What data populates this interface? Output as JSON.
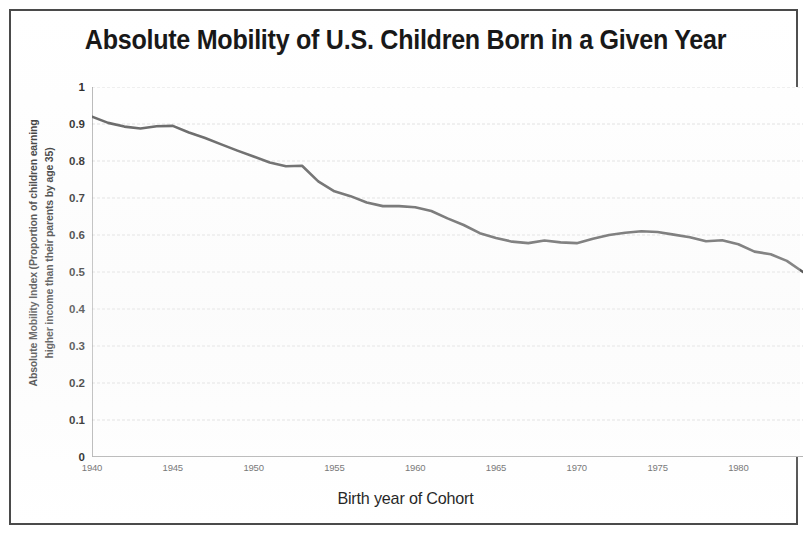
{
  "chart_data": {
    "type": "line",
    "title": "Absolute Mobility of U.S. Children Born in a Given Year",
    "xlabel": "Birth year of Cohort",
    "ylabel": "Absolute Mobility Index (Proportion of children earning higher income than their parents by age 35)",
    "ylabel_line1": "Absolute Mobility Index (Proportion of children earning",
    "ylabel_line2": "higher income than their parents by age 35)",
    "xlim": [
      1940,
      1984
    ],
    "ylim": [
      0,
      1
    ],
    "ytick_labels": [
      "1",
      "0.9",
      "0.8",
      "0.7",
      "0.6",
      "0.5",
      "0.4",
      "0.3",
      "0.2",
      "0.1",
      "0"
    ],
    "ytick_values": [
      1,
      0.9,
      0.8,
      0.7,
      0.6,
      0.5,
      0.4,
      0.3,
      0.2,
      0.1,
      0
    ],
    "xtick_labels": [
      "1940",
      "1945",
      "1950",
      "1955",
      "1960",
      "1965",
      "1970",
      "1975",
      "1980"
    ],
    "xtick_values": [
      1940,
      1945,
      1950,
      1955,
      1960,
      1965,
      1970,
      1975,
      1980
    ],
    "x_minor_tick_step": 1,
    "grid": true,
    "grid_axis": "y",
    "grid_color": "#d9d9d9",
    "legend": false,
    "line_color": "#595959",
    "line_width": 2.6,
    "series": [
      {
        "name": "Absolute Mobility Index",
        "x": [
          1940,
          1941,
          1942,
          1943,
          1944,
          1945,
          1946,
          1947,
          1948,
          1949,
          1950,
          1951,
          1952,
          1953,
          1954,
          1955,
          1956,
          1957,
          1958,
          1959,
          1960,
          1961,
          1962,
          1963,
          1964,
          1965,
          1966,
          1967,
          1968,
          1969,
          1970,
          1971,
          1972,
          1973,
          1974,
          1975,
          1976,
          1977,
          1978,
          1979,
          1980,
          1981,
          1982,
          1983,
          1984
        ],
        "values": [
          0.92,
          0.903,
          0.893,
          0.888,
          0.894,
          0.895,
          0.877,
          0.862,
          0.845,
          0.828,
          0.812,
          0.796,
          0.786,
          0.787,
          0.745,
          0.718,
          0.705,
          0.688,
          0.678,
          0.678,
          0.675,
          0.665,
          0.645,
          0.627,
          0.605,
          0.592,
          0.582,
          0.578,
          0.585,
          0.58,
          0.578,
          0.59,
          0.6,
          0.606,
          0.61,
          0.608,
          0.601,
          0.594,
          0.583,
          0.586,
          0.575,
          0.555,
          0.548,
          0.53,
          0.5
        ]
      }
    ]
  }
}
